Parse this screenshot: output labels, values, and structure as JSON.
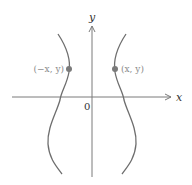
{
  "figure": {
    "axes": {
      "x_label": "x",
      "y_label": "y",
      "origin_label": "0"
    },
    "points": [
      {
        "label": "(−x, y)",
        "side": "left"
      },
      {
        "label": "(x, y)",
        "side": "right"
      }
    ],
    "colors": {
      "axis": "#7a7a7a",
      "curve": "#6e6e6e",
      "point": "#7a7a7a",
      "point_label": "#8a8a8a",
      "text": "#333333"
    }
  }
}
